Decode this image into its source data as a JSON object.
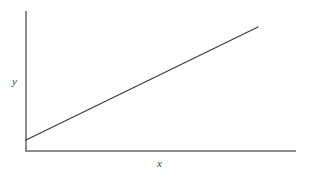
{
  "figure": {
    "background_color": "#ffffff",
    "width": 311,
    "height": 179
  },
  "axes": {
    "x_label": "x",
    "y_label": "y",
    "axis_color": "#8c8c8c",
    "x_axis": {
      "x_start": 25,
      "x_end": 296,
      "y": 151
    },
    "y_axis": {
      "x": 26,
      "y_start": 11,
      "y_end": 151
    }
  },
  "chart_data": {
    "type": "line",
    "title": "",
    "subtitle": "",
    "xlabel": "x",
    "ylabel": "y",
    "grid": false,
    "legend": false,
    "legend_position": "none",
    "xticks": [],
    "yticks": [],
    "xtick_labels": [],
    "ytick_labels": [],
    "xlim": [
      0,
      1
    ],
    "ylim": [
      0,
      1
    ],
    "annotations": [],
    "series": [
      {
        "name": "linear relationship",
        "color": "#3d3d3d",
        "line_width": 1.3,
        "x": [
          0.0,
          0.25,
          0.5,
          0.75,
          1.0
        ],
        "y": [
          0.0787,
          0.2811,
          0.4835,
          0.6859,
          0.8883
        ],
        "description": "straight line with positive slope and positive y-intercept",
        "pixel_start": [
          26,
          140
        ],
        "pixel_end": [
          258,
          27
        ]
      }
    ]
  }
}
